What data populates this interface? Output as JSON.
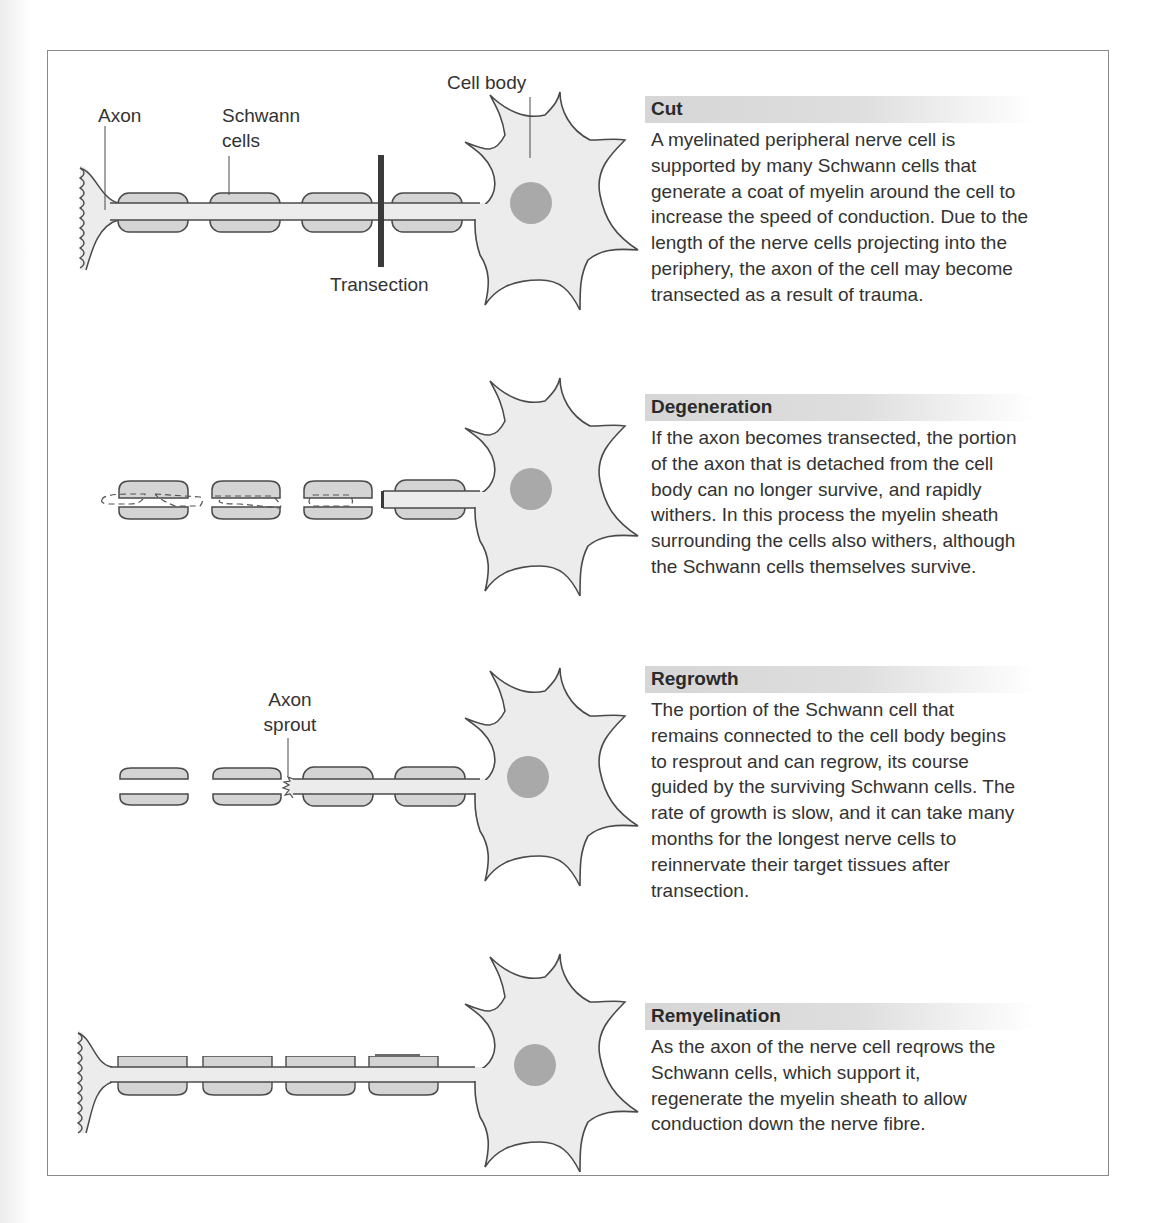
{
  "figure": {
    "panels": [
      {
        "id": "cut",
        "title": "Cut",
        "body": "A myelinated peripheral nerve cell is\nsupported by many Schwann cells that\ngenerate a coat of myelin around the cell to\nincrease the speed of conduction. Due to the\nlength of the nerve cells projecting into the\nperiphery, the axon of the cell may become\ntransected as a result of trauma.",
        "labels": {
          "axon": "Axon",
          "schwann_line1": "Schwann",
          "schwann_line2": "cells",
          "cell_body": "Cell body",
          "transection": "Transection"
        }
      },
      {
        "id": "degeneration",
        "title": "Degeneration",
        "body": "If the axon becomes transected, the portion\nof the axon that is detached from the cell\nbody can no longer survive, and rapidly\nwithers. In this process the myelin sheath\nsurrounding the cells also withers, although\nthe Schwann cells themselves survive."
      },
      {
        "id": "regrowth",
        "title": "Regrowth",
        "body": "The portion of the Schwann cell that\nremains connected to the cell body begins\nto resprout and can regrow, its course\nguided by the surviving Schwann cells. The\nrate of growth is slow, and it can take many\nmonths for the longest nerve cells to\nreinnervate their target tissues after\ntransection.",
        "labels": {
          "sprout_line1": "Axon",
          "sprout_line2": "sprout"
        }
      },
      {
        "id": "remyelination",
        "title": "Remyelination",
        "body": "As the axon of the nerve cell reqrows the\nSchwann cells, which support it,\nregenerate the myelin sheath to allow\nconduction down the nerve fibre."
      }
    ],
    "colors": {
      "cell_fill": "#ececec",
      "schwann_fill": "#d4d4d4",
      "nucleus": "#a9a9a9",
      "outline": "#4a4a4a",
      "transection_bar": "#3a3a3a",
      "frame": "#8a8a8a"
    }
  }
}
